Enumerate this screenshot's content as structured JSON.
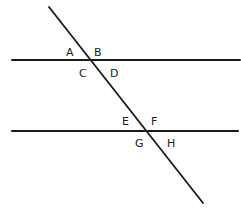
{
  "diagram": {
    "colors": {
      "line": "#1a1a1a",
      "label": "#222222",
      "background": "#ffffff"
    },
    "lines": [
      {
        "id": "upper-parallel",
        "x1": 12,
        "y1": 60,
        "x2": 240,
        "y2": 60
      },
      {
        "id": "lower-parallel",
        "x1": 12,
        "y1": 131,
        "x2": 238,
        "y2": 131
      },
      {
        "id": "transversal",
        "x1": 49,
        "y1": 7,
        "x2": 203,
        "y2": 203
      }
    ],
    "angle_labels": [
      {
        "text": "A",
        "x": 66,
        "y": 56
      },
      {
        "text": "B",
        "x": 94,
        "y": 56
      },
      {
        "text": "C",
        "x": 79,
        "y": 77
      },
      {
        "text": "D",
        "x": 110,
        "y": 77
      },
      {
        "text": "E",
        "x": 122,
        "y": 125
      },
      {
        "text": "F",
        "x": 151,
        "y": 125
      },
      {
        "text": "G",
        "x": 135,
        "y": 147
      },
      {
        "text": "H",
        "x": 167,
        "y": 147
      }
    ]
  }
}
